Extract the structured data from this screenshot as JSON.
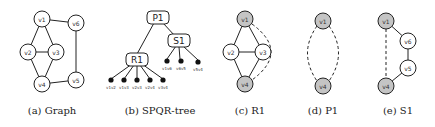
{
  "panels": {
    "graph": {
      "caption": "(a) Graph",
      "nodes": [
        {
          "id": "v1",
          "label": "v1",
          "x": 42,
          "y": 19
        },
        {
          "id": "v6",
          "label": "v6",
          "x": 76,
          "y": 23
        },
        {
          "id": "v2",
          "label": "v2",
          "x": 28,
          "y": 52
        },
        {
          "id": "v3",
          "label": "v3",
          "x": 56,
          "y": 52
        },
        {
          "id": "v4",
          "label": "v4",
          "x": 42,
          "y": 84
        },
        {
          "id": "v5",
          "label": "v5",
          "x": 76,
          "y": 80
        }
      ],
      "edges": [
        [
          "v1",
          "v6"
        ],
        [
          "v1",
          "v2"
        ],
        [
          "v1",
          "v3"
        ],
        [
          "v2",
          "v3"
        ],
        [
          "v2",
          "v4"
        ],
        [
          "v3",
          "v4"
        ],
        [
          "v4",
          "v5"
        ],
        [
          "v6",
          "v5"
        ]
      ]
    },
    "spqr": {
      "caption": "(b) SPQR-tree",
      "tree_nodes": [
        {
          "id": "P1",
          "label": "P1",
          "x": 158,
          "y": 17
        },
        {
          "id": "S1",
          "label": "S1",
          "x": 179,
          "y": 41
        },
        {
          "id": "R1",
          "label": "R1",
          "x": 137,
          "y": 59
        }
      ],
      "tree_edges": [
        [
          "P1",
          "R1"
        ],
        [
          "P1",
          "S1"
        ]
      ],
      "r1_leaves": [
        "v1v2",
        "v1v3",
        "v2v3",
        "v2v4",
        "v3v4"
      ],
      "s1_leaves": [
        "v1v6",
        "v6v5",
        "v5v4"
      ]
    },
    "r1": {
      "caption": "(c) R1",
      "nodes": [
        {
          "id": "v1",
          "label": "v1",
          "x": 245,
          "y": 19,
          "shaded": true
        },
        {
          "id": "v2",
          "label": "v2",
          "x": 231,
          "y": 52,
          "shaded": false
        },
        {
          "id": "v3",
          "label": "v3",
          "x": 263,
          "y": 52,
          "shaded": false
        },
        {
          "id": "v4",
          "label": "v4",
          "x": 245,
          "y": 84,
          "shaded": true
        }
      ]
    },
    "p1": {
      "caption": "(d) P1",
      "nodes": [
        {
          "id": "v1",
          "label": "v1",
          "x": 323,
          "y": 21,
          "shaded": true
        },
        {
          "id": "v4",
          "label": "v4",
          "x": 323,
          "y": 86,
          "shaded": true
        }
      ]
    },
    "s1": {
      "caption": "(e) S1",
      "nodes": [
        {
          "id": "v1",
          "label": "v1",
          "x": 386,
          "y": 21,
          "shaded": true
        },
        {
          "id": "v6",
          "label": "v6",
          "x": 408,
          "y": 41,
          "shaded": false
        },
        {
          "id": "v5",
          "label": "v5",
          "x": 408,
          "y": 68,
          "shaded": false
        },
        {
          "id": "v4",
          "label": "v4",
          "x": 386,
          "y": 86,
          "shaded": true
        }
      ]
    }
  }
}
